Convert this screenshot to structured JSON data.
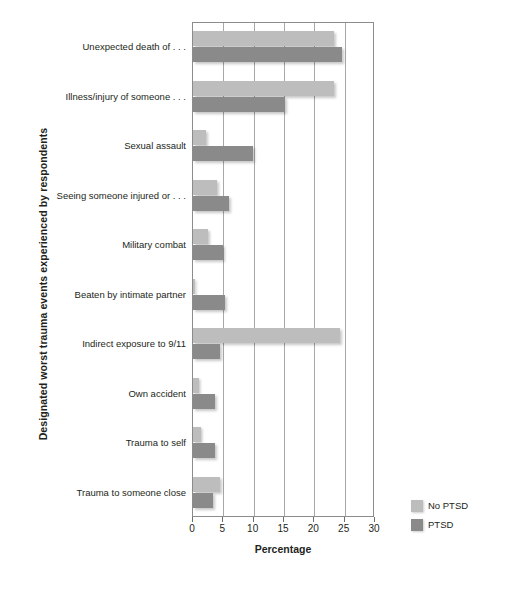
{
  "chart_data": {
    "type": "bar",
    "orientation": "horizontal",
    "title": "",
    "xlabel": "Percentage",
    "ylabel": "Designated worst trauma events experienced by respondents",
    "xlim": [
      0,
      30
    ],
    "xticks": [
      0,
      5,
      10,
      15,
      20,
      25,
      30
    ],
    "xtick_labels": [
      "0",
      "5",
      "10",
      "15",
      "20",
      "25",
      "30"
    ],
    "grid": "vertical",
    "legend_position": "bottom-right",
    "categories": [
      "Unexpected death of . . .",
      "Illness/injury of someone . . .",
      "Sexual assault",
      "Seeing someone injured or . . .",
      "Military combat",
      "Beaten by intimate partner",
      "Indirect exposure to 9/11",
      "Own accident",
      "Trauma to self",
      "Trauma to someone close"
    ],
    "series": [
      {
        "name": "No PTSD",
        "color": "#bdbdbd",
        "values": [
          23.3,
          23.3,
          2.1,
          3.9,
          2.4,
          0.4,
          24.2,
          1.0,
          1.4,
          4.4
        ]
      },
      {
        "name": "PTSD",
        "color": "#8a8a8a",
        "values": [
          24.6,
          15.1,
          9.9,
          5.9,
          4.9,
          5.3,
          4.4,
          3.7,
          3.7,
          3.3
        ]
      }
    ]
  },
  "legend": {
    "items": [
      {
        "label": "No PTSD",
        "color": "#bdbdbd"
      },
      {
        "label": "PTSD",
        "color": "#8a8a8a"
      }
    ]
  },
  "axes": {
    "x_title": "Percentage",
    "y_title": "Designated worst trauma events experienced by respondents"
  },
  "credit": "© Cengage Learning 2013"
}
